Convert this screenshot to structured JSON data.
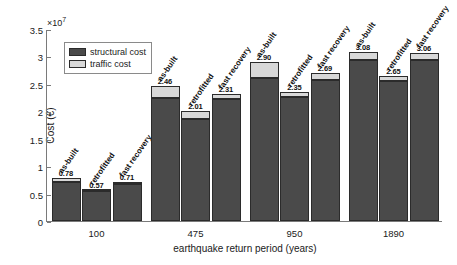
{
  "chart_data": {
    "type": "bar",
    "title": "",
    "xlabel": "earthquake return period (years)",
    "ylabel": "Cost (€)",
    "y_multiplier": "×10",
    "y_exponent": "7",
    "ylim": [
      0,
      3.5
    ],
    "yticks": [
      "0",
      "0.5",
      "1",
      "1.5",
      "2",
      "2.5",
      "3",
      "3.5"
    ],
    "ytick_values": [
      0,
      0.5,
      1,
      1.5,
      2,
      2.5,
      3,
      3.5
    ],
    "grid": false,
    "legend_position": "upper left",
    "legend": [
      "structural cost",
      "traffic cost"
    ],
    "colors": {
      "structural cost": "#4a4a4a",
      "traffic cost": "#d8d8d8",
      "edge": "#2b2b2b",
      "axis": "#7a7a7a",
      "text": "#1a1a1a"
    },
    "categories": [
      "100",
      "475",
      "950",
      "1890"
    ],
    "subcategories": [
      "as-built",
      "retrofitted",
      "fast recovery"
    ],
    "series": [
      {
        "name": "structural cost",
        "values": [
          [
            0.71,
            0.54,
            0.68
          ],
          [
            2.25,
            1.86,
            2.22
          ],
          [
            2.6,
            2.26,
            2.57
          ],
          [
            2.94,
            2.56,
            2.93
          ]
        ]
      },
      {
        "name": "traffic cost",
        "values": [
          [
            0.07,
            0.03,
            0.03
          ],
          [
            0.21,
            0.15,
            0.09
          ],
          [
            0.3,
            0.09,
            0.12
          ],
          [
            0.14,
            0.09,
            0.13
          ]
        ]
      }
    ],
    "totals": [
      [
        0.78,
        0.57,
        0.71
      ],
      [
        2.46,
        2.01,
        2.31
      ],
      [
        2.9,
        2.35,
        2.69
      ],
      [
        3.08,
        2.65,
        3.06
      ]
    ],
    "total_labels": [
      [
        "0.78",
        "0.57",
        "0.71"
      ],
      [
        "2.46",
        "2.01",
        "2.31"
      ],
      [
        "2.90",
        "2.35",
        "2.69"
      ],
      [
        "3.08",
        "2.65",
        "3.06"
      ]
    ]
  }
}
